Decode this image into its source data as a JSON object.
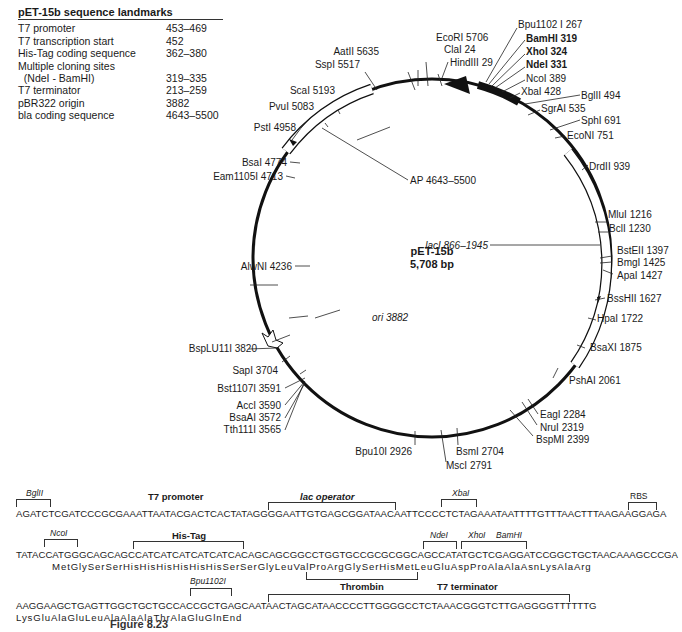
{
  "landmarks": {
    "title": "pET-15b sequence landmarks",
    "rows": [
      {
        "label": "T7 promoter",
        "value": "453–469"
      },
      {
        "label": "T7 transcription start",
        "value": "452"
      },
      {
        "label": "His-Tag coding sequence",
        "value": "362–380"
      },
      {
        "label": "Multiple cloning sites",
        "value": ""
      },
      {
        "label": "  (NdeI - BamHI)",
        "value": "319–335"
      },
      {
        "label": "T7 terminator",
        "value": "213–259"
      },
      {
        "label": "pBR322 origin",
        "value": "3882"
      },
      {
        "label": "bla coding sequence",
        "value": "4643–5500"
      }
    ]
  },
  "plasmid": {
    "name": "pET-15b",
    "size": "5,708 bp",
    "features": {
      "ap": "AP 4643–5500",
      "laci": "lacI 866–1945",
      "ori": "ori  3882"
    },
    "sites": [
      {
        "id": "bpu1102i",
        "text": "Bpu1102 I 267"
      },
      {
        "id": "bamhi",
        "text": "BamHI 319",
        "bold": true
      },
      {
        "id": "xhoi",
        "text": "XhoI 324",
        "bold": true
      },
      {
        "id": "ndei",
        "text": "NdeI 331",
        "bold": true
      },
      {
        "id": "ncoi",
        "text": "NcoI 389"
      },
      {
        "id": "xbai",
        "text": "XbaI 428"
      },
      {
        "id": "bglii",
        "text": "BglII 494"
      },
      {
        "id": "sgrai",
        "text": "SgrAI 535"
      },
      {
        "id": "sphi",
        "text": "SphI 691"
      },
      {
        "id": "econi",
        "text": "EcoNI 751"
      },
      {
        "id": "drdii",
        "text": "DrdII 939"
      },
      {
        "id": "mlui",
        "text": "MluI 1216"
      },
      {
        "id": "bcli",
        "text": "BclI 1230"
      },
      {
        "id": "bsteii",
        "text": "BstEII 1397"
      },
      {
        "id": "bmgi",
        "text": "BmgI 1425"
      },
      {
        "id": "apai",
        "text": "ApaI 1427"
      },
      {
        "id": "bsshii",
        "text": "BssHII 1627"
      },
      {
        "id": "hpai",
        "text": "HpaI 1722"
      },
      {
        "id": "bsaxi",
        "text": "BsaXI 1875"
      },
      {
        "id": "pshai",
        "text": "PshAI 2061"
      },
      {
        "id": "eagi",
        "text": "EagI 2284"
      },
      {
        "id": "nrui",
        "text": "NruI 2319"
      },
      {
        "id": "bspmi",
        "text": "BspMI 2399"
      },
      {
        "id": "bsmi",
        "text": "BsmI 2704"
      },
      {
        "id": "msci",
        "text": "MscI 2791"
      },
      {
        "id": "bpu10i",
        "text": "Bpu10I 2926"
      },
      {
        "id": "tth111i",
        "text": "Tth111I 3565"
      },
      {
        "id": "bsaai",
        "text": "BsaAI 3572"
      },
      {
        "id": "acci",
        "text": "AccI 3590"
      },
      {
        "id": "bst1107i",
        "text": "Bst1107I 3591"
      },
      {
        "id": "sapi",
        "text": "SapI 3704"
      },
      {
        "id": "bsplu11i",
        "text": "BspLU11I 3820"
      },
      {
        "id": "alwni",
        "text": "AlwNI 4236"
      },
      {
        "id": "eam1105i",
        "text": "Eam1105I 4713"
      },
      {
        "id": "bsai",
        "text": "BsaI 4774"
      },
      {
        "id": "psti",
        "text": "PstI 4958"
      },
      {
        "id": "pvui",
        "text": "PvuI 5083"
      },
      {
        "id": "scai",
        "text": "ScaI 5193"
      },
      {
        "id": "sspi",
        "text": "SspI 5517"
      },
      {
        "id": "aatii",
        "text": "AatII 5635"
      },
      {
        "id": "ecori",
        "text": "EcoRI 5706"
      },
      {
        "id": "clai",
        "text": "ClaI 24"
      },
      {
        "id": "hindiii",
        "text": "HindIII 29"
      }
    ]
  },
  "sequence": {
    "line1": "AGATCTCGATCCCGCGAAATTAATACGACTCACTATAGGGGAATTGTGAGCGGATAACAATTCCCCTCTAGAAATAATTTTGTTTAACTTTAAGAAGGAGA",
    "line2": "TATACCATGGGCAGCAGCCATCATCATCATCATCACAGCAGCGGCCTGGTGCCGCGCGGCAGCCATATGCTCGAGGATCCGGCTGCTAACAAAGCCCGA",
    "line2_aa": "MetGlySerSerHisHisHisHisHisHisSerSerGlyLeuValProArgGlySerHisMetLeuGluAspProAlaAlaAsnLysAlaArg",
    "line3": "AAGGAAGCTGAGTTGGCTGCTGCCACCGCTGAGCAATAACTAGCATAACCCCTTGGGGCCTCTAAACGGGTCTTGAGGGGTTTTTTG",
    "line3_aa": "LysGluAlaGluLeuAlaAlaAlaThrAlaGluGlnEnd",
    "labels": {
      "bglii": "BglII",
      "t7_promoter": "T7 promoter",
      "lac_operator": "lac operator",
      "xbai": "XbaI",
      "rbs": "RBS",
      "ncoi": "NcoI",
      "his_tag": "His-Tag",
      "ndei": "NdeI",
      "xhoi": "XhoI",
      "bamhi": "BamHI",
      "bpu1102i": "Bpu1102I",
      "thrombin": "Thrombin",
      "t7_terminator": "T7 terminator"
    }
  },
  "caption": "Figure 8.23"
}
